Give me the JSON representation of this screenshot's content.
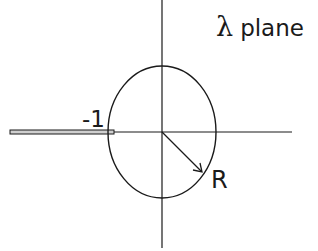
{
  "diagram": {
    "title_symbol": "λ",
    "title_text": "plane",
    "point_label": "-1",
    "radius_label": "R",
    "colors": {
      "stroke": "#1a1a1a",
      "background": "#ffffff",
      "cut_fill": "#cfcfcf"
    },
    "elements": {
      "real_axis": {
        "x1": 10,
        "x2": 292,
        "y": 132
      },
      "imag_axis": {
        "x": 162,
        "y1": 0,
        "y2": 248
      },
      "circle": {
        "cx": 162,
        "cy": 132,
        "rx": 54,
        "ry": 66
      },
      "branch_cut": {
        "x1": 10,
        "x2": 114,
        "y": 132
      },
      "radius_arrow": {
        "x1": 162,
        "y1": 132,
        "x2": 202,
        "y2": 172
      }
    }
  }
}
